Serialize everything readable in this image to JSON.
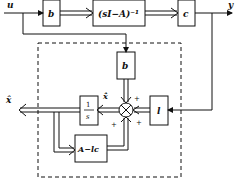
{
  "diagram": {
    "type": "block-diagram",
    "signals": {
      "input": "u",
      "output": "y",
      "estimate": "x̂",
      "estimate_derivative": "x̂̇"
    },
    "blocks": {
      "plant_b": "b",
      "plant_tf": "(sI−A)⁻¹",
      "plant_c": "c",
      "observer_b": "b",
      "integrator_num": "1",
      "integrator_den": "s",
      "gain_l": "l",
      "feedback": "A−lc"
    },
    "summing_signs": [
      "+",
      "+",
      "+"
    ],
    "observer_boundary": "dashed"
  }
}
